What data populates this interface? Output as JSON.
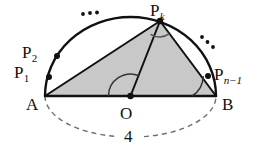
{
  "figure": {
    "background_color": "#ffffff",
    "stroke_color": "#111111",
    "fill_color": "#c8c8c8",
    "dashed_color": "#6f6f6f"
  },
  "labels": {
    "p_k": {
      "base": "P",
      "sub": "k"
    },
    "p_2": {
      "base": "P",
      "sub": "2"
    },
    "p_1": {
      "base": "P",
      "sub": "1"
    },
    "p_n_minus_1": {
      "base": "P",
      "sub": "n−1"
    },
    "a": "A",
    "b": "B",
    "o": "O",
    "diameter_value": "4",
    "ellipsis_left": "···",
    "ellipsis_right": "···"
  },
  "geometry": {
    "points": {
      "A": {
        "x": 45,
        "y": 96
      },
      "B": {
        "x": 216,
        "y": 96
      },
      "O": {
        "x": 130.5,
        "y": 96
      },
      "P_k": {
        "x": 160,
        "y": 21
      },
      "P_1": {
        "x": 49,
        "y": 77
      },
      "P_2": {
        "x": 57,
        "y": 56
      },
      "P_n_minus_1": {
        "x": 208,
        "y": 76
      }
    },
    "radius": 85.5,
    "diameter": 4,
    "angle_marks": [
      {
        "at": "P_k",
        "type": "arc"
      },
      {
        "at": "O",
        "type": "arc"
      },
      {
        "at": "B",
        "type": "arc"
      }
    ],
    "shaded_triangle": [
      "A",
      "P_k",
      "B"
    ],
    "segments": [
      "A-B",
      "A-P_k",
      "P_k-B",
      "O-P_k"
    ],
    "upper_arc": "A to B (solid)",
    "lower_arc": "A to B (dashed)"
  }
}
